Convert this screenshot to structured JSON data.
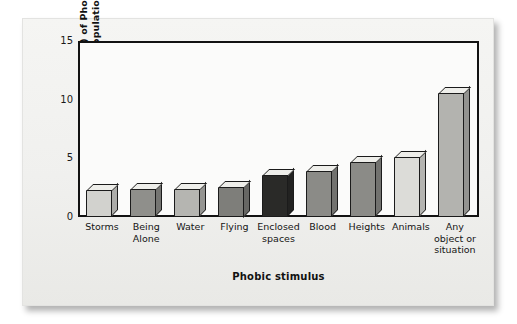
{
  "figure": {
    "background_color": "#f2f2f0",
    "plot_background_color": "#fbfbfa",
    "axis_color": "#121212"
  },
  "chart_data": {
    "type": "bar",
    "title": "",
    "xlabel": "Phobic stimulus",
    "ylabel": "Prevalence (%) of Phobia in general population",
    "categories": [
      "Storms",
      "Being Alone",
      "Water",
      "Flying",
      "Enclosed spaces",
      "Blood",
      "Heights",
      "Animals",
      "Any object or situation"
    ],
    "category_lines": [
      [
        "Storms"
      ],
      [
        "Being",
        "Alone"
      ],
      [
        "Water"
      ],
      [
        "Flying"
      ],
      [
        "Enclosed",
        "spaces"
      ],
      [
        "Blood"
      ],
      [
        "Heights"
      ],
      [
        "Animals"
      ],
      [
        "Any",
        "object or",
        "situation"
      ]
    ],
    "values": [
      2.3,
      2.4,
      2.4,
      2.6,
      3.6,
      3.9,
      4.7,
      5.1,
      10.6
    ],
    "bar_colors": [
      "#d2d2ce",
      "#8f8f8b",
      "#b5b5b1",
      "#7e7e7a",
      "#2a2a28",
      "#8b8b87",
      "#8b8b87",
      "#dcdcd8",
      "#b3b3af"
    ],
    "yticks": [
      0,
      5,
      10,
      15
    ],
    "ytick_labels": [
      "0",
      "5",
      "10",
      "15"
    ],
    "ylim": [
      0,
      15
    ],
    "grid": false,
    "legend": "none",
    "style": "3d-bar"
  }
}
